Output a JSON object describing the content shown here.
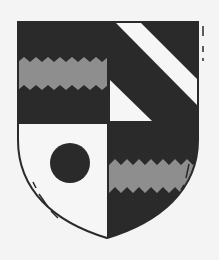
{
  "image": {
    "subject": "heraldic shield (coat of arms)",
    "quarters": [
      {
        "position": "top-left",
        "field": "dark",
        "charge": "wavy gray fess"
      },
      {
        "position": "top-right",
        "field": "dark",
        "charge": "white bend and white triangle"
      },
      {
        "position": "bottom-left",
        "field": "white",
        "charge": "dark roundel"
      },
      {
        "position": "bottom-right",
        "field": "dark",
        "charge": "wavy gray fess"
      }
    ],
    "colors": {
      "dark": "#2a2a2a",
      "light": "#f6f6f6",
      "gray": "#8e8e8e",
      "background": "#f4f4f4"
    }
  }
}
